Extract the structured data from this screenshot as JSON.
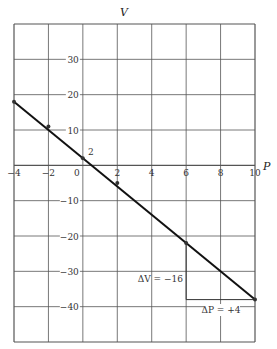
{
  "chart_data": {
    "type": "line",
    "title": "",
    "xlabel": "P",
    "ylabel": "V",
    "xlim": [
      -4,
      10
    ],
    "ylim": [
      -50,
      40
    ],
    "grid": true,
    "x_ticks": [
      -4,
      -2,
      0,
      2,
      4,
      6,
      8,
      10
    ],
    "y_ticks": [
      30,
      20,
      10,
      -10,
      -20,
      -30,
      -40
    ],
    "series": [
      {
        "name": "V = 2 - 4P",
        "x": [
          -4,
          10
        ],
        "y": [
          18,
          -38
        ]
      }
    ],
    "points": [
      {
        "x": -4,
        "y": 18
      },
      {
        "x": -2,
        "y": 11
      },
      {
        "x": 0,
        "y": 2
      },
      {
        "x": 2,
        "y": -5
      },
      {
        "x": 6,
        "y": -22
      },
      {
        "x": 10,
        "y": -38
      }
    ],
    "annotations": [
      {
        "text": "2",
        "x": 0,
        "y": 2,
        "note": "V-intercept label"
      },
      {
        "text": "ΔV = −16",
        "x": 6,
        "y": -30
      },
      {
        "text": "ΔP = +4",
        "x": 8,
        "y": -38
      }
    ],
    "slope_triangle": {
      "from": [
        6,
        -22
      ],
      "corner": [
        6,
        -38
      ],
      "to": [
        10,
        -38
      ]
    }
  },
  "labels": {
    "x_axis": "P",
    "y_axis": "V",
    "intercept": "2",
    "delta_v": "ΔV = −16",
    "delta_p": "ΔP = +4"
  }
}
